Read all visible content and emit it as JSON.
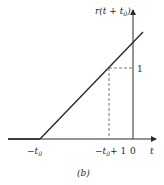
{
  "figure": {
    "caption": "(b)",
    "y_axis_label": "r(t + t",
    "y_axis_label_sub": "0",
    "y_axis_label_close": ")",
    "x_axis_label": "t",
    "ticks": {
      "neg_t0": {
        "prefix": "−t",
        "sub": "0"
      },
      "neg_t0_plus_1": {
        "prefix": "−t",
        "sub": "0",
        "suffix": "+ 1"
      },
      "zero": "0",
      "one": "1"
    },
    "function": "ramp shifted: r(t + t0), zero for t < −t0, slope 1 afterwards",
    "line_color": "#2a2a2a",
    "dashed_color": "#555555"
  }
}
